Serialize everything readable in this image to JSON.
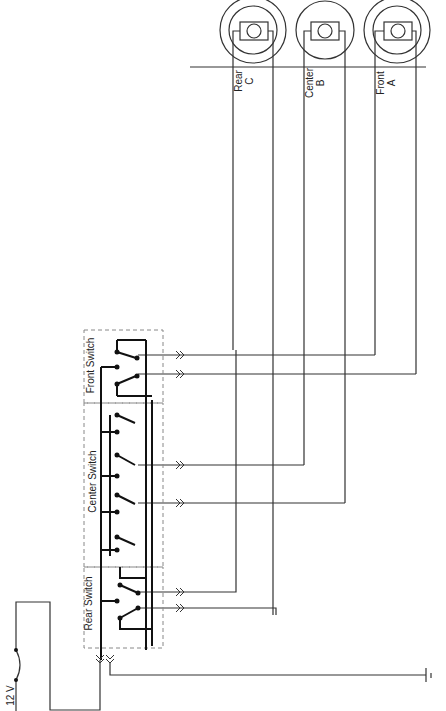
{
  "diagram": {
    "power": {
      "label": "12 V"
    },
    "switches": [
      {
        "label": "Front Switch"
      },
      {
        "label": "Center Switch"
      },
      {
        "label": "Rear Switch"
      }
    ],
    "lamps": [
      {
        "name": "Rear",
        "letter": "C"
      },
      {
        "name": "Center",
        "letter": "B"
      },
      {
        "name": "Front",
        "letter": "A"
      }
    ],
    "ground": {
      "symbol": "ground"
    },
    "colors": {
      "wire": "#333333",
      "box": "#888888"
    }
  }
}
